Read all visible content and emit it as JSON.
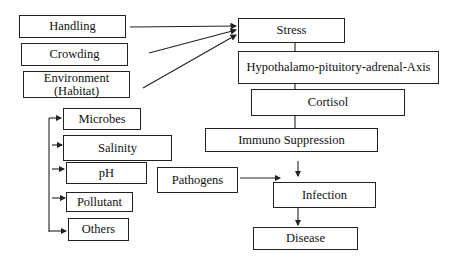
{
  "diagram": {
    "type": "flowchart",
    "stressors": [
      {
        "id": "handling",
        "label": "Handling"
      },
      {
        "id": "crowding",
        "label": "Crowding"
      },
      {
        "id": "environment",
        "label": "Environment (Habitat)",
        "line1": "Environment",
        "line2": "(Habitat)"
      }
    ],
    "environment_factors": [
      {
        "id": "microbes",
        "label": "Microbes"
      },
      {
        "id": "salinity",
        "label": "Salinity"
      },
      {
        "id": "ph",
        "label": "pH"
      },
      {
        "id": "pollutant",
        "label": "Pollutant"
      },
      {
        "id": "others",
        "label": "Others"
      }
    ],
    "chain": [
      {
        "id": "stress",
        "label": "Stress"
      },
      {
        "id": "hpa",
        "label": "Hypothalamo-pituitory-adrenal-Axis"
      },
      {
        "id": "cortisol",
        "label": "Cortisol"
      },
      {
        "id": "immuno",
        "label": "Immuno Suppression"
      },
      {
        "id": "infection",
        "label": "Infection"
      },
      {
        "id": "disease",
        "label": "Disease"
      }
    ],
    "side_input": {
      "id": "pathogens",
      "label": "Pathogens"
    },
    "edges": [
      [
        "Handling",
        "Stress"
      ],
      [
        "Crowding",
        "Stress"
      ],
      [
        "Environment (Habitat)",
        "Stress"
      ],
      [
        "Stress",
        "Hypothalamo-pituitory-adrenal-Axis"
      ],
      [
        "Hypothalamo-pituitory-adrenal-Axis",
        "Cortisol"
      ],
      [
        "Cortisol",
        "Immuno Suppression"
      ],
      [
        "Immuno Suppression",
        "Infection"
      ],
      [
        "Pathogens",
        "Infection"
      ],
      [
        "Infection",
        "Disease"
      ],
      [
        "bracket",
        "Microbes"
      ],
      [
        "bracket",
        "Salinity"
      ],
      [
        "bracket",
        "pH"
      ],
      [
        "bracket",
        "Pollutant"
      ],
      [
        "bracket",
        "Others"
      ]
    ],
    "line_color": "#222222"
  }
}
